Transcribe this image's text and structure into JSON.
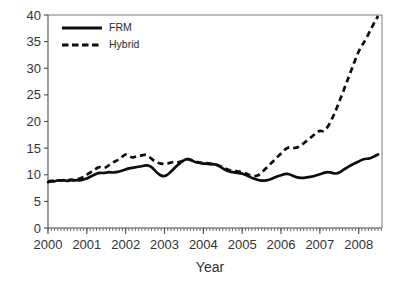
{
  "chart_data": {
    "type": "line",
    "title": "",
    "subtitle": "",
    "xlabel": "Year",
    "ylabel": "",
    "xlim": [
      2000.0,
      2008.6
    ],
    "ylim": [
      0,
      40
    ],
    "y_ticks": [
      0,
      5,
      10,
      15,
      20,
      25,
      30,
      35,
      40
    ],
    "x_ticks": [
      2000,
      2001,
      2002,
      2003,
      2004,
      2005,
      2006,
      2007,
      2008
    ],
    "x_tick_labels": [
      "2000",
      "2001",
      "2002",
      "2003",
      "2004",
      "2005",
      "2006",
      "2007",
      "2008"
    ],
    "y_tick_labels": [
      "0",
      "5",
      "10",
      "15",
      "20",
      "25",
      "30",
      "35",
      "40"
    ],
    "x_minor_tick_interval": 0.08333,
    "grid": false,
    "legend_position": "top-left",
    "legend": [
      "FRM",
      "Hybrid"
    ],
    "annotations": [],
    "series": [
      {
        "name": "FRM",
        "style": "solid",
        "color": "#0d0d0d",
        "x": [
          2000.0,
          2000.083,
          2000.167,
          2000.25,
          2000.333,
          2000.417,
          2000.5,
          2000.583,
          2000.667,
          2000.75,
          2000.833,
          2000.917,
          2001.0,
          2001.083,
          2001.167,
          2001.25,
          2001.333,
          2001.417,
          2001.5,
          2001.583,
          2001.667,
          2001.75,
          2001.833,
          2001.917,
          2002.0,
          2002.083,
          2002.167,
          2002.25,
          2002.333,
          2002.417,
          2002.5,
          2002.583,
          2002.667,
          2002.75,
          2002.833,
          2002.917,
          2003.0,
          2003.083,
          2003.167,
          2003.25,
          2003.333,
          2003.417,
          2003.5,
          2003.583,
          2003.667,
          2003.75,
          2003.833,
          2003.917,
          2004.0,
          2004.083,
          2004.167,
          2004.25,
          2004.333,
          2004.417,
          2004.5,
          2004.583,
          2004.667,
          2004.75,
          2004.833,
          2004.917,
          2005.0,
          2005.083,
          2005.167,
          2005.25,
          2005.333,
          2005.417,
          2005.5,
          2005.583,
          2005.667,
          2005.75,
          2005.833,
          2005.917,
          2006.0,
          2006.083,
          2006.167,
          2006.25,
          2006.333,
          2006.417,
          2006.5,
          2006.583,
          2006.667,
          2006.75,
          2006.833,
          2006.917,
          2007.0,
          2007.083,
          2007.167,
          2007.25,
          2007.333,
          2007.417,
          2007.5,
          2007.583,
          2007.667,
          2007.75,
          2007.833,
          2007.917,
          2008.0,
          2008.083,
          2008.167,
          2008.25,
          2008.333,
          2008.417,
          2008.5
        ],
        "values": [
          8.6,
          8.8,
          8.7,
          9.0,
          8.9,
          9.0,
          8.8,
          9.0,
          8.9,
          9.0,
          8.9,
          9.1,
          9.3,
          9.6,
          9.9,
          10.2,
          10.4,
          10.3,
          10.4,
          10.5,
          10.4,
          10.5,
          10.6,
          10.8,
          11.0,
          11.2,
          11.3,
          11.4,
          11.5,
          11.6,
          11.8,
          11.7,
          11.5,
          10.8,
          10.2,
          9.8,
          9.7,
          10.0,
          10.6,
          11.2,
          11.8,
          12.3,
          12.7,
          13.0,
          12.8,
          12.5,
          12.3,
          12.2,
          12.1,
          12.1,
          12.0,
          12.0,
          11.9,
          11.6,
          11.2,
          10.8,
          10.6,
          10.5,
          10.4,
          10.3,
          10.2,
          10.0,
          9.7,
          9.4,
          9.2,
          9.0,
          8.9,
          8.9,
          9.0,
          9.2,
          9.5,
          9.7,
          9.9,
          10.1,
          10.2,
          10.0,
          9.7,
          9.5,
          9.4,
          9.4,
          9.5,
          9.6,
          9.7,
          9.9,
          10.1,
          10.3,
          10.5,
          10.5,
          10.3,
          10.2,
          10.4,
          10.8,
          11.2,
          11.6,
          11.9,
          12.2,
          12.5,
          12.8,
          13.0,
          13.0,
          13.2,
          13.5,
          13.8
        ]
      },
      {
        "name": "Hybrid",
        "style": "dashed",
        "color": "#0d0d0d",
        "x": [
          2000.0,
          2000.083,
          2000.167,
          2000.25,
          2000.333,
          2000.417,
          2000.5,
          2000.583,
          2000.667,
          2000.75,
          2000.833,
          2000.917,
          2001.0,
          2001.083,
          2001.167,
          2001.25,
          2001.333,
          2001.417,
          2001.5,
          2001.583,
          2001.667,
          2001.75,
          2001.833,
          2001.917,
          2002.0,
          2002.083,
          2002.167,
          2002.25,
          2002.333,
          2002.417,
          2002.5,
          2002.583,
          2002.667,
          2002.75,
          2002.833,
          2002.917,
          2003.0,
          2003.083,
          2003.167,
          2003.25,
          2003.333,
          2003.417,
          2003.5,
          2003.583,
          2003.667,
          2003.75,
          2003.833,
          2003.917,
          2004.0,
          2004.083,
          2004.167,
          2004.25,
          2004.333,
          2004.417,
          2004.5,
          2004.583,
          2004.667,
          2004.75,
          2004.833,
          2004.917,
          2005.0,
          2005.083,
          2005.167,
          2005.25,
          2005.333,
          2005.417,
          2005.5,
          2005.583,
          2005.667,
          2005.75,
          2005.833,
          2005.917,
          2006.0,
          2006.083,
          2006.167,
          2006.25,
          2006.333,
          2006.417,
          2006.5,
          2006.583,
          2006.667,
          2006.75,
          2006.833,
          2006.917,
          2007.0,
          2007.083,
          2007.167,
          2007.25,
          2007.333,
          2007.417,
          2007.5,
          2007.583,
          2007.667,
          2007.75,
          2007.833,
          2007.917,
          2008.0,
          2008.083,
          2008.167,
          2008.25,
          2008.333,
          2008.417,
          2008.5
        ],
        "values": [
          8.7,
          8.9,
          8.8,
          9.0,
          8.9,
          9.0,
          8.9,
          9.1,
          9.0,
          9.2,
          9.3,
          9.6,
          10.0,
          10.4,
          10.8,
          11.2,
          11.5,
          11.2,
          11.4,
          11.9,
          12.3,
          12.6,
          12.9,
          13.4,
          13.9,
          13.5,
          13.2,
          13.4,
          13.6,
          13.6,
          13.8,
          13.5,
          13.0,
          12.5,
          12.2,
          12.1,
          12.0,
          12.1,
          12.3,
          12.4,
          12.3,
          12.5,
          12.7,
          13.0,
          12.8,
          12.6,
          12.4,
          12.3,
          12.2,
          12.2,
          12.1,
          12.0,
          11.9,
          11.7,
          11.4,
          11.1,
          10.9,
          10.8,
          10.7,
          10.6,
          10.5,
          10.3,
          10.0,
          9.8,
          9.7,
          9.9,
          10.4,
          11.0,
          11.6,
          12.2,
          12.8,
          13.4,
          14.0,
          14.6,
          15.1,
          15.2,
          15.0,
          15.1,
          15.4,
          15.9,
          16.4,
          16.9,
          17.4,
          17.9,
          18.3,
          18.1,
          18.6,
          19.6,
          20.8,
          22.2,
          23.7,
          25.3,
          26.9,
          28.5,
          30.1,
          31.7,
          33.2,
          34.3,
          35.2,
          36.4,
          37.6,
          38.8,
          39.8
        ]
      }
    ]
  },
  "legend": {
    "items": [
      {
        "label": "FRM",
        "style": "solid"
      },
      {
        "label": "Hybrid",
        "style": "dashed"
      }
    ]
  },
  "axes": {
    "x_title": "Year"
  }
}
